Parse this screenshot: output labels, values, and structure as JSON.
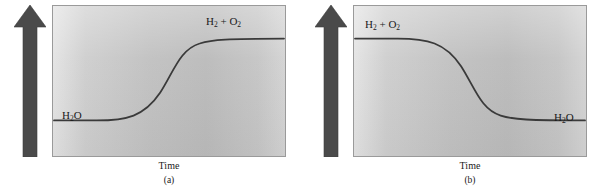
{
  "figure": {
    "type": "potential-energy-diagram-pair",
    "background_color": "#ffffff",
    "curve_color": "#3a3a3a",
    "arrow_color": "#4a4a4a",
    "plot_border_color": "#9a9a9a"
  },
  "panels": [
    {
      "id": "a",
      "caption": "(a)",
      "y_axis_label": "Potential energy",
      "x_axis_label": "Time",
      "start_label_html": "H<sub>2</sub>O",
      "start_label_text": "H2O",
      "end_label_html": "H<sub>2</sub> + O<sub>2</sub>",
      "end_label_text": "H2 + O2",
      "curve_direction": "endothermic-rising",
      "curve_path": "M 1 116 L 44 116 C 74 116, 92 112, 108 88 C 122 66, 128 44, 148 38 C 160 34, 176 33, 233 33"
    },
    {
      "id": "b",
      "caption": "(b)",
      "y_axis_label": "Potential energy",
      "x_axis_label": "Time",
      "start_label_html": "H<sub>2</sub> + O<sub>2</sub>",
      "start_label_text": "H2 + O2",
      "end_label_html": "H<sub>2</sub>O",
      "end_label_text": "H2O",
      "curve_direction": "exothermic-falling",
      "curve_path": "M 1 33 L 44 33 C 74 33, 92 37, 108 61 C 122 83, 128 105, 148 111 C 160 115, 176 116, 233 116"
    }
  ],
  "chart_data": {
    "type": "line",
    "title": "",
    "xlabel": "Time",
    "ylabel": "Potential energy",
    "grid": false,
    "legend": "none",
    "series": [
      {
        "name": "(a) H2O -> H2 + O2 (endothermic)",
        "annotations": [
          {
            "text": "H2O",
            "position": "left-low-plateau"
          },
          {
            "text": "H2 + O2",
            "position": "right-high-plateau"
          }
        ],
        "x": [
          0,
          0.1,
          0.2,
          0.3,
          0.4,
          0.46,
          0.52,
          0.58,
          0.64,
          0.72,
          0.82,
          1.0
        ],
        "y": [
          0.24,
          0.24,
          0.24,
          0.25,
          0.3,
          0.38,
          0.5,
          0.62,
          0.71,
          0.76,
          0.78,
          0.78
        ]
      },
      {
        "name": "(b) H2 + O2 -> H2O (exothermic)",
        "annotations": [
          {
            "text": "H2 + O2",
            "position": "left-high-plateau"
          },
          {
            "text": "H2O",
            "position": "right-low-plateau"
          }
        ],
        "x": [
          0,
          0.1,
          0.2,
          0.3,
          0.4,
          0.46,
          0.52,
          0.58,
          0.64,
          0.72,
          0.82,
          1.0
        ],
        "y": [
          0.78,
          0.78,
          0.78,
          0.77,
          0.72,
          0.64,
          0.52,
          0.4,
          0.31,
          0.26,
          0.24,
          0.24
        ]
      }
    ],
    "xlim": [
      0,
      1
    ],
    "ylim": [
      0,
      1
    ]
  }
}
